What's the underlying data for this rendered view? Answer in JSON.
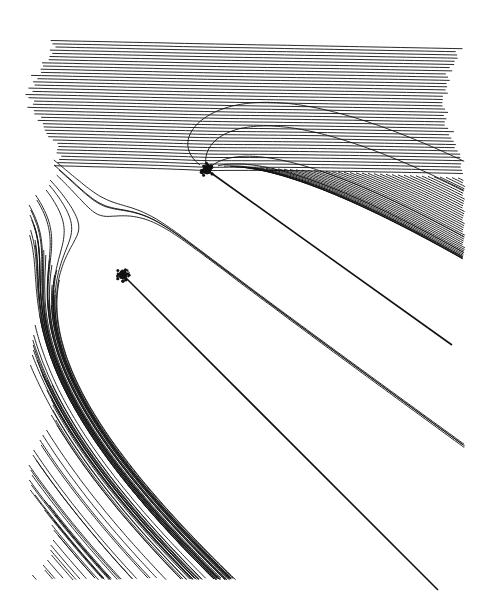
{
  "figure": {
    "background": "#ffffff",
    "ink": "#111111",
    "sources": [
      {
        "name": "upper-source",
        "x": 207,
        "y": 170
      },
      {
        "name": "lower-source",
        "x": 123,
        "y": 275
      }
    ],
    "wakes": [
      {
        "name": "upper-wake",
        "from": [
          207,
          170
        ],
        "to": [
          452,
          345
        ]
      },
      {
        "name": "lower-wake",
        "from": [
          123,
          275
        ],
        "to": [
          438,
          590
        ]
      }
    ],
    "bounds": {
      "left": 30,
      "top": 30,
      "right": 460,
      "bottom": 580
    }
  }
}
